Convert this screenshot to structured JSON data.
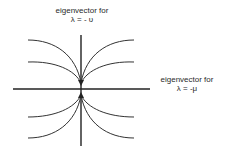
{
  "diagram": {
    "type": "phase-portrait-node",
    "vertical_axis_label": {
      "line1": "eigenvector  for",
      "line2": "λ = - υ"
    },
    "horizontal_axis_label": {
      "line1": "eigenvector for",
      "line2": "λ = -μ"
    },
    "colors": {
      "axis": "#222222",
      "curve": "#333333",
      "text": "#2a2a2a"
    }
  }
}
